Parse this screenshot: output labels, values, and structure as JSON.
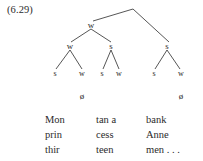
{
  "figure": {
    "example_number": "(6.29)",
    "type": "metrical-tree",
    "accent_color": "#2b2b2b",
    "background_color": "#ffffff"
  },
  "tree": {
    "root": {
      "label": "",
      "x": 133,
      "y": 7
    },
    "level1": [
      {
        "label": "w",
        "x": 91,
        "y": 25
      }
    ],
    "level2": [
      {
        "label": "w",
        "x": 70,
        "y": 46
      },
      {
        "label": "s",
        "x": 111,
        "y": 46
      },
      {
        "label": "s",
        "x": 167,
        "y": 46
      }
    ],
    "level3": [
      {
        "label": "s",
        "x": 55,
        "y": 74
      },
      {
        "label": "w",
        "x": 82,
        "y": 74
      },
      {
        "label": "s",
        "x": 102,
        "y": 74
      },
      {
        "label": "w",
        "x": 119,
        "y": 74
      },
      {
        "label": "s",
        "x": 154,
        "y": 74
      },
      {
        "label": "w",
        "x": 181,
        "y": 74
      }
    ],
    "null_nodes": [
      {
        "label": "ø",
        "x": 82,
        "y": 96
      },
      {
        "label": "ø",
        "x": 181,
        "y": 96
      }
    ],
    "edges": [
      {
        "x1": 133,
        "y1": 9,
        "x2": 93,
        "y2": 21
      },
      {
        "x1": 133,
        "y1": 9,
        "x2": 169,
        "y2": 42
      },
      {
        "x1": 91,
        "y1": 29,
        "x2": 71,
        "y2": 42
      },
      {
        "x1": 91,
        "y1": 29,
        "x2": 111,
        "y2": 42
      },
      {
        "x1": 70,
        "y1": 50,
        "x2": 56,
        "y2": 69
      },
      {
        "x1": 70,
        "y1": 50,
        "x2": 82,
        "y2": 69
      },
      {
        "x1": 111,
        "y1": 50,
        "x2": 103,
        "y2": 69
      },
      {
        "x1": 111,
        "y1": 50,
        "x2": 119,
        "y2": 69
      },
      {
        "x1": 167,
        "y1": 50,
        "x2": 155,
        "y2": 69
      },
      {
        "x1": 167,
        "y1": 50,
        "x2": 180,
        "y2": 69
      }
    ]
  },
  "text_rows": [
    [
      "Mon",
      "tan a",
      "bank"
    ],
    [
      "prin",
      "cess",
      "Anne"
    ],
    [
      "thir",
      "teen",
      "men . . ."
    ]
  ]
}
